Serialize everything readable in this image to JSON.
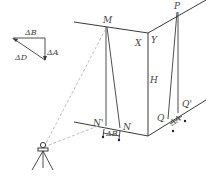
{
  "diagram": {
    "inset": {
      "label_top": "ΔB",
      "label_right": "ΔA",
      "label_hyp": "ΔD"
    },
    "points": {
      "M": "M",
      "P": "P",
      "X": "X",
      "Y": "Y",
      "H": "H",
      "N_prime": "N'",
      "N": "N",
      "Q": "Q",
      "Q_prime": "Q'"
    },
    "offsets": {
      "left_bottom": "ΔB",
      "right_bottom": "ΔA"
    },
    "instrument": "total-station-on-tripod",
    "colors": {
      "line": "#3a3a3a",
      "sightline": "#b8b8b8",
      "text": "#444444"
    }
  }
}
